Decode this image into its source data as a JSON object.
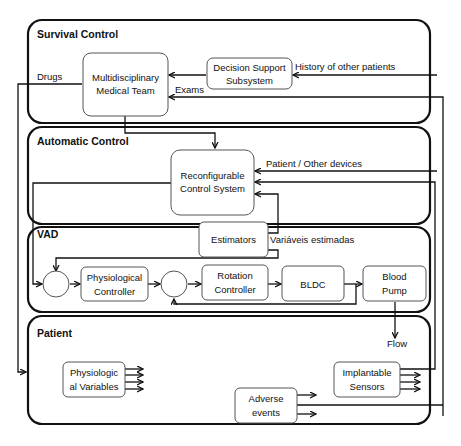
{
  "regions": {
    "survival": {
      "title": "Survival Control"
    },
    "automatic": {
      "title": "Automatic Control"
    },
    "vad": {
      "title": "VAD"
    },
    "patient": {
      "title": "Patient"
    }
  },
  "blocks": {
    "medical_team": [
      "Multidisciplinary",
      "Medical Team"
    ],
    "decision_support": [
      "Decision Support",
      "Subsystem"
    ],
    "reconfigurable": [
      "Reconfigurable",
      "Control System"
    ],
    "estimators": "Estimators",
    "physiological_controller": [
      "Physiological",
      "Controller"
    ],
    "rotation_controller": [
      "Rotation",
      "Controller"
    ],
    "bldc": "BLDC",
    "blood_pump": [
      "Blood",
      "Pump"
    ],
    "physiological_variables": [
      "Physiologic",
      "al Variables"
    ],
    "adverse_events": [
      "Adverse",
      "events"
    ],
    "implantable_sensors": [
      "Implantable",
      "Sensors"
    ]
  },
  "labels": {
    "drugs": "Drugs",
    "history": "History of other patients",
    "exams": "Exams",
    "patient_other": "Patient / Other devices",
    "estimated_vars": "Variáveis estimadas",
    "flow": "Flow"
  }
}
